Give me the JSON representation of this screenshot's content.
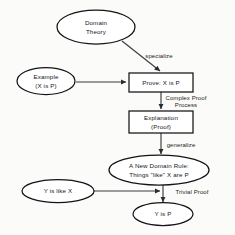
{
  "diagram": {
    "background_color": "#fbfbfa",
    "shape_fill": "#ffffff",
    "shape_stroke": "#141417",
    "connector_color": "#3b3c40",
    "text_color": "#15161a",
    "nodes": [
      {
        "id": "domain-theory",
        "shape": "ellipse",
        "lines": [
          "Domain",
          "Theory"
        ],
        "cx": 96,
        "cy": 27,
        "rx": 39,
        "ry": 17
      },
      {
        "id": "example",
        "shape": "ellipse",
        "lines": [
          "Example",
          "(X is P)"
        ],
        "cx": 46,
        "cy": 81,
        "rx": 29,
        "ry": 13.5
      },
      {
        "id": "prove-x-is-p",
        "shape": "rectangle",
        "lines": [
          "Prove: X is P"
        ],
        "x": 129,
        "y": 73,
        "width": 64,
        "height": 19
      },
      {
        "id": "explanation-proof",
        "shape": "rectangle",
        "lines": [
          "Explanation",
          "(Proof)"
        ],
        "x": 129,
        "y": 111,
        "width": 64,
        "height": 22
      },
      {
        "id": "new-domain-rule",
        "shape": "ellipse",
        "lines": [
          "A New Domain Rule:",
          "Things \"like\" X are P"
        ],
        "cx": 159,
        "cy": 170,
        "rx": 50,
        "ry": 15
      },
      {
        "id": "y-is-like-x",
        "shape": "ellipse",
        "lines": [
          "Y is like X"
        ],
        "cx": 58,
        "cy": 191,
        "rx": 36,
        "ry": 11.5
      },
      {
        "id": "y-is-p",
        "shape": "ellipse",
        "lines": [
          "Y is P"
        ],
        "cx": 163,
        "cy": 214,
        "rx": 30,
        "ry": 11.5
      }
    ],
    "edges": [
      {
        "id": "specialize",
        "from": "domain-theory",
        "to": "prove-x-is-p",
        "label": "specialize",
        "label_x": 159,
        "label_y": 56,
        "path": "M 122 41 L 160 71"
      },
      {
        "id": "example-to-prove",
        "from": "example",
        "to": "prove-x-is-p",
        "label": "",
        "label_x": 0,
        "label_y": 0,
        "path": "M 76 82 L 126 82"
      },
      {
        "id": "complex-proof-process",
        "from": "prove-x-is-p",
        "to": "explanation-proof",
        "label": "Complex Proof",
        "label2": "Process",
        "label_x": 186,
        "label_y": 98,
        "label2_x": 186,
        "label2_y": 105,
        "path": "M 161 92 L 161 109"
      },
      {
        "id": "generalize",
        "from": "explanation-proof",
        "to": "new-domain-rule",
        "label": "generalize",
        "label_x": 181,
        "label_y": 145,
        "path": "M 161 133 L 161 154"
      },
      {
        "id": "trivial-proof",
        "from": "new-domain-rule",
        "to": "y-is-p",
        "label": "Trivial Proof",
        "label_x": 192,
        "label_y": 192,
        "path": "M 163 185 L 163 202"
      },
      {
        "id": "y-is-like-x-to-y-is-p",
        "from": "y-is-like-x",
        "to": "trivial-proof",
        "label": "",
        "label_x": 0,
        "label_y": 0,
        "path": "M 94 191 L 160 191"
      }
    ]
  }
}
